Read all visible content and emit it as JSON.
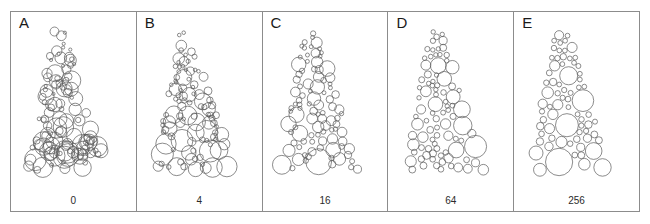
{
  "figure": {
    "background_color": "#ffffff",
    "frame_color": "#8c8c8c",
    "circle_stroke_color": "#5a5a5a",
    "circle_fill": "none",
    "circle_stroke_width": 0.7,
    "width": 650,
    "height": 224
  },
  "chart_data": {
    "type": "scatter",
    "title": "",
    "xlabel": "",
    "ylabel": "",
    "grid": false,
    "legend": "none",
    "panels": [
      {
        "letter": "A",
        "value": "0",
        "value_number": 0,
        "overlap": 1.0,
        "count": 118,
        "seed": 11,
        "radius_min": 1.6,
        "radius_max": 9.5
      },
      {
        "letter": "B",
        "value": "4",
        "value_number": 4,
        "overlap": 0.62,
        "count": 104,
        "seed": 27,
        "radius_min": 1.8,
        "radius_max": 10.0
      },
      {
        "letter": "C",
        "value": "16",
        "value_number": 16,
        "overlap": 0.34,
        "count": 96,
        "seed": 43,
        "radius_min": 2.0,
        "radius_max": 10.5
      },
      {
        "letter": "D",
        "value": "64",
        "value_number": 64,
        "overlap": 0.14,
        "count": 88,
        "seed": 61,
        "radius_min": 2.2,
        "radius_max": 11.5
      },
      {
        "letter": "E",
        "value": "256",
        "value_number": 256,
        "overlap": 0.0,
        "count": 84,
        "seed": 83,
        "radius_min": 2.4,
        "radius_max": 12.0
      }
    ]
  }
}
